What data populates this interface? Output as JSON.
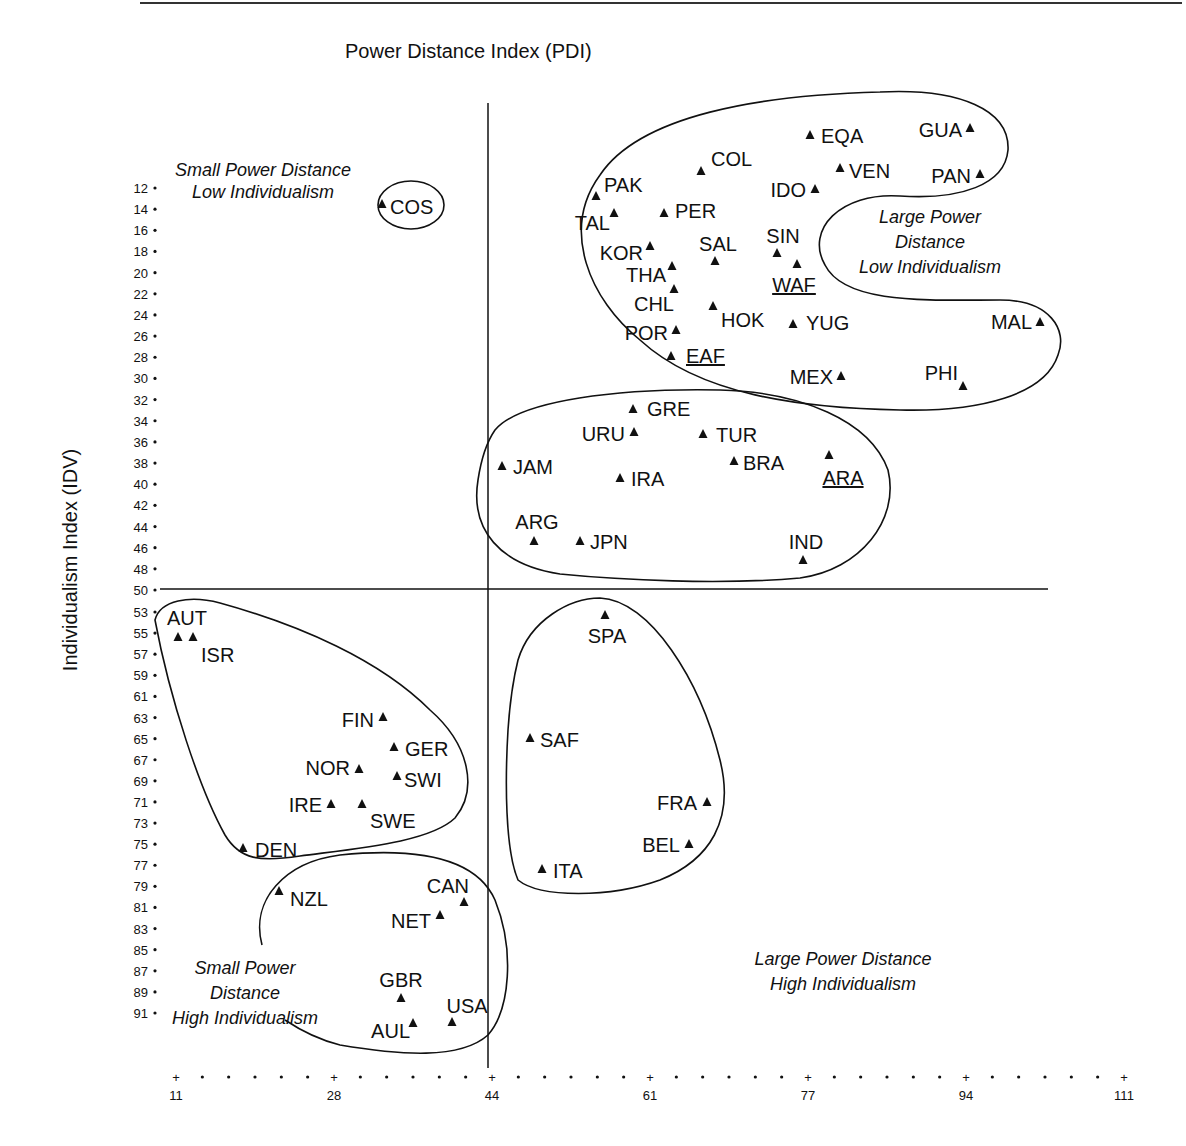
{
  "chart_data": {
    "type": "scatter",
    "title": "",
    "xlabel": "Power Distance Index (PDI)",
    "ylabel": "Individualism Index (IDV)",
    "x_ticks": [
      11,
      28,
      44,
      61,
      77,
      94,
      111
    ],
    "y_ticks": [
      12,
      14,
      16,
      18,
      20,
      22,
      24,
      26,
      28,
      30,
      32,
      34,
      36,
      38,
      40,
      42,
      44,
      46,
      48,
      50,
      53,
      55,
      57,
      59,
      61,
      63,
      65,
      67,
      69,
      71,
      73,
      75,
      77,
      79,
      81,
      83,
      85,
      87,
      89,
      91
    ],
    "xlim": [
      11,
      111
    ],
    "ylim_inverted": [
      10,
      93
    ],
    "grid": false,
    "divider_x": 44,
    "divider_y": 50,
    "marker": "triangle",
    "quadrant_labels": [
      {
        "name": "small-pd-low-idv",
        "lines": [
          "Small Power Distance",
          "Low Individualism"
        ]
      },
      {
        "name": "large-pd-low-idv",
        "lines": [
          "Large Power",
          "Distance",
          "Low Individualism"
        ]
      },
      {
        "name": "small-pd-high-idv",
        "lines": [
          "Small Power",
          "Distance",
          "High Individualism"
        ]
      },
      {
        "name": "large-pd-high-idv",
        "lines": [
          "Large Power Distance",
          "High Individualism"
        ]
      }
    ],
    "points": [
      {
        "label": "COS",
        "pdi": 35,
        "idv": 15,
        "px": 382,
        "py": 204,
        "lx": 390,
        "ly": 214,
        "anchor": "start"
      },
      {
        "label": "PAK",
        "pdi": 55,
        "idv": 14,
        "px": 596,
        "py": 196,
        "lx": 604,
        "ly": 192,
        "anchor": "start"
      },
      {
        "label": "TAL",
        "pdi": 58,
        "idv": 17,
        "px": 614,
        "py": 213,
        "lx": 610,
        "ly": 230,
        "anchor": "end"
      },
      {
        "label": "COL",
        "pdi": 67,
        "idv": 13,
        "px": 701,
        "py": 171,
        "lx": 711,
        "ly": 166,
        "anchor": "start"
      },
      {
        "label": "PER",
        "pdi": 64,
        "idv": 16,
        "px": 664,
        "py": 213,
        "lx": 675,
        "ly": 218,
        "anchor": "start"
      },
      {
        "label": "EQA",
        "pdi": 78,
        "idv": 8,
        "px": 810,
        "py": 135,
        "lx": 821,
        "ly": 143,
        "anchor": "start"
      },
      {
        "label": "GUA",
        "pdi": 95,
        "idv": 6,
        "px": 970,
        "py": 128,
        "lx": 962,
        "ly": 137,
        "anchor": "end"
      },
      {
        "label": "VEN",
        "pdi": 81,
        "idv": 12,
        "px": 840,
        "py": 168,
        "lx": 849,
        "ly": 178,
        "anchor": "start"
      },
      {
        "label": "PAN",
        "pdi": 95,
        "idv": 11,
        "px": 980,
        "py": 174,
        "lx": 971,
        "ly": 183,
        "anchor": "end"
      },
      {
        "label": "IDO",
        "pdi": 78,
        "idv": 14,
        "px": 815,
        "py": 189,
        "lx": 806,
        "ly": 197,
        "anchor": "end"
      },
      {
        "label": "KOR",
        "pdi": 60,
        "idv": 18,
        "px": 650,
        "py": 246,
        "lx": 643,
        "ly": 260,
        "anchor": "end"
      },
      {
        "label": "SAL",
        "pdi": 66,
        "idv": 19,
        "px": 715,
        "py": 261,
        "lx": 718,
        "ly": 251,
        "anchor": "middle"
      },
      {
        "label": "SIN",
        "pdi": 74,
        "idv": 20,
        "px": 777,
        "py": 253,
        "lx": 783,
        "ly": 243,
        "anchor": "middle"
      },
      {
        "label": "WAF",
        "pdi": 77,
        "idv": 20,
        "px": 797,
        "py": 264,
        "lx": 794,
        "ly": 292,
        "anchor": "middle",
        "underline": true
      },
      {
        "label": "THA",
        "pdi": 64,
        "idv": 20,
        "px": 672,
        "py": 266,
        "lx": 666,
        "ly": 282,
        "anchor": "end"
      },
      {
        "label": "CHL",
        "pdi": 63,
        "idv": 23,
        "px": 674,
        "py": 289,
        "lx": 674,
        "ly": 311,
        "anchor": "end"
      },
      {
        "label": "HOK",
        "pdi": 68,
        "idv": 25,
        "px": 713,
        "py": 306,
        "lx": 721,
        "ly": 327,
        "anchor": "start"
      },
      {
        "label": "YUG",
        "pdi": 76,
        "idv": 27,
        "px": 793,
        "py": 324,
        "lx": 806,
        "ly": 330,
        "anchor": "start"
      },
      {
        "label": "MAL",
        "pdi": 104,
        "idv": 26,
        "px": 1040,
        "py": 322,
        "lx": 1032,
        "ly": 329,
        "anchor": "end"
      },
      {
        "label": "POR",
        "pdi": 63,
        "idv": 27,
        "px": 676,
        "py": 330,
        "lx": 668,
        "ly": 340,
        "anchor": "end"
      },
      {
        "label": "EAF",
        "pdi": 64,
        "idv": 27,
        "px": 671,
        "py": 356,
        "lx": 686,
        "ly": 363,
        "anchor": "start",
        "underline": true
      },
      {
        "label": "MEX",
        "pdi": 81,
        "idv": 30,
        "px": 841,
        "py": 376,
        "lx": 833,
        "ly": 384,
        "anchor": "end"
      },
      {
        "label": "PHI",
        "pdi": 94,
        "idv": 32,
        "px": 963,
        "py": 386,
        "lx": 958,
        "ly": 380,
        "anchor": "end"
      },
      {
        "label": "GRE",
        "pdi": 60,
        "idv": 35,
        "px": 633,
        "py": 409,
        "lx": 647,
        "ly": 416,
        "anchor": "start"
      },
      {
        "label": "URU",
        "pdi": 61,
        "idv": 36,
        "px": 634,
        "py": 432,
        "lx": 625,
        "ly": 441,
        "anchor": "end"
      },
      {
        "label": "TUR",
        "pdi": 66,
        "idv": 37,
        "px": 703,
        "py": 434,
        "lx": 716,
        "ly": 442,
        "anchor": "start"
      },
      {
        "label": "JAM",
        "pdi": 45,
        "idv": 39,
        "px": 502,
        "py": 466,
        "lx": 513,
        "ly": 474,
        "anchor": "start"
      },
      {
        "label": "BRA",
        "pdi": 69,
        "idv": 38,
        "px": 734,
        "py": 461,
        "lx": 743,
        "ly": 470,
        "anchor": "start"
      },
      {
        "label": "ARA",
        "pdi": 80,
        "idv": 38,
        "px": 829,
        "py": 455,
        "lx": 843,
        "ly": 485,
        "anchor": "middle",
        "underline": true
      },
      {
        "label": "IRA",
        "pdi": 58,
        "idv": 41,
        "px": 620,
        "py": 478,
        "lx": 631,
        "ly": 486,
        "anchor": "start"
      },
      {
        "label": "ARG",
        "pdi": 49,
        "idv": 46,
        "px": 534,
        "py": 541,
        "lx": 537,
        "ly": 529,
        "anchor": "middle"
      },
      {
        "label": "JPN",
        "pdi": 54,
        "idv": 46,
        "px": 580,
        "py": 541,
        "lx": 590,
        "ly": 549,
        "anchor": "start"
      },
      {
        "label": "IND",
        "pdi": 77,
        "idv": 48,
        "px": 803,
        "py": 560,
        "lx": 806,
        "ly": 549,
        "anchor": "middle"
      },
      {
        "label": "AUT",
        "pdi": 11,
        "idv": 55,
        "px": 178,
        "py": 637,
        "lx": 187,
        "ly": 625,
        "anchor": "middle"
      },
      {
        "label": "ISR",
        "pdi": 13,
        "idv": 54,
        "px": 193,
        "py": 637,
        "lx": 201,
        "ly": 662,
        "anchor": "start"
      },
      {
        "label": "SPA",
        "pdi": 57,
        "idv": 51,
        "px": 605,
        "py": 615,
        "lx": 607,
        "ly": 643,
        "anchor": "middle"
      },
      {
        "label": "FIN",
        "pdi": 33,
        "idv": 63,
        "px": 383,
        "py": 717,
        "lx": 374,
        "ly": 727,
        "anchor": "end"
      },
      {
        "label": "GER",
        "pdi": 35,
        "idv": 67,
        "px": 394,
        "py": 747,
        "lx": 405,
        "ly": 756,
        "anchor": "start"
      },
      {
        "label": "NOR",
        "pdi": 31,
        "idv": 69,
        "px": 359,
        "py": 769,
        "lx": 350,
        "ly": 775,
        "anchor": "end"
      },
      {
        "label": "SWI",
        "pdi": 34,
        "idv": 68,
        "px": 397,
        "py": 776,
        "lx": 404,
        "ly": 787,
        "anchor": "start"
      },
      {
        "label": "IRE",
        "pdi": 28,
        "idv": 70,
        "px": 331,
        "py": 804,
        "lx": 322,
        "ly": 812,
        "anchor": "end"
      },
      {
        "label": "SWE",
        "pdi": 31,
        "idv": 71,
        "px": 362,
        "py": 804,
        "lx": 370,
        "ly": 828,
        "anchor": "start"
      },
      {
        "label": "SAF",
        "pdi": 49,
        "idv": 65,
        "px": 530,
        "py": 738,
        "lx": 540,
        "ly": 747,
        "anchor": "start"
      },
      {
        "label": "FRA",
        "pdi": 68,
        "idv": 71,
        "px": 707,
        "py": 802,
        "lx": 697,
        "ly": 810,
        "anchor": "end"
      },
      {
        "label": "BEL",
        "pdi": 65,
        "idv": 75,
        "px": 689,
        "py": 844,
        "lx": 680,
        "ly": 852,
        "anchor": "end"
      },
      {
        "label": "DEN",
        "pdi": 18,
        "idv": 74,
        "px": 243,
        "py": 848,
        "lx": 255,
        "ly": 857,
        "anchor": "start"
      },
      {
        "label": "ITA",
        "pdi": 50,
        "idv": 76,
        "px": 542,
        "py": 869,
        "lx": 553,
        "ly": 878,
        "anchor": "start"
      },
      {
        "label": "NZL",
        "pdi": 22,
        "idv": 79,
        "px": 279,
        "py": 891,
        "lx": 290,
        "ly": 906,
        "anchor": "start"
      },
      {
        "label": "CAN",
        "pdi": 39,
        "idv": 80,
        "px": 464,
        "py": 902,
        "lx": 469,
        "ly": 893,
        "anchor": "end"
      },
      {
        "label": "NET",
        "pdi": 38,
        "idv": 80,
        "px": 440,
        "py": 915,
        "lx": 431,
        "ly": 928,
        "anchor": "end"
      },
      {
        "label": "GBR",
        "pdi": 35,
        "idv": 89,
        "px": 401,
        "py": 998,
        "lx": 401,
        "ly": 987,
        "anchor": "middle"
      },
      {
        "label": "USA",
        "pdi": 40,
        "idv": 91,
        "px": 452,
        "py": 1022,
        "lx": 467,
        "ly": 1013,
        "anchor": "middle"
      },
      {
        "label": "AUL",
        "pdi": 36,
        "idv": 90,
        "px": 413,
        "py": 1023,
        "lx": 410,
        "ly": 1038,
        "anchor": "end"
      }
    ]
  },
  "header": {
    "x_axis_title": "Power Distance Index (PDI)",
    "y_axis_title": "Individualism Index (IDV)"
  }
}
